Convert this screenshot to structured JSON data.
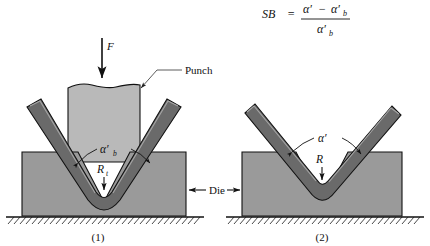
{
  "figure": {
    "title_formula": {
      "lhs": "SB",
      "equals": "=",
      "numerator_a": "α′",
      "numerator_minus": "−",
      "numerator_b": "α′",
      "numerator_b_sub": "b",
      "denominator": "α′",
      "denominator_sub": "b",
      "full_text": "SB = (α′ − α′b) / α′b"
    },
    "background_color": "#ffffff",
    "colors": {
      "punch_fill": "#b9b9b9",
      "die_fill": "#9a9a9a",
      "sheet_fill": "#6a6a6a",
      "sheet_highlight": "#8e8e8e",
      "outline": "#111111",
      "leader": "#4a4a4a",
      "ground_hatch": "#1a1a1a"
    },
    "panels": [
      {
        "id": "panel-1",
        "caption": "(1)",
        "force_label": "F",
        "punch_label": "Punch",
        "angle_label": "α′",
        "angle_label_sub": "b",
        "radius_label": "R",
        "radius_label_sub": "t",
        "description": "Loaded V-bend: punch presses sheet into die, bend angle alpha-prime-b, radius R-t"
      },
      {
        "id": "panel-2",
        "caption": "(2)",
        "angle_label": "α′",
        "radius_label": "R",
        "description": "After springback: punch removed, sheet opens to angle alpha-prime with radius R"
      }
    ],
    "shared_labels": {
      "die_label": "Die"
    }
  }
}
